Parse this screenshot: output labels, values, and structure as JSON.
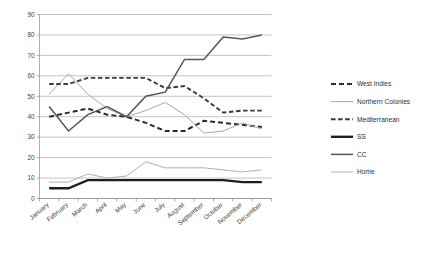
{
  "chart_data": {
    "type": "line",
    "title": "",
    "subtitle": "",
    "xlabel": "",
    "ylabel": "",
    "ylim": [
      0,
      90
    ],
    "ytick_step": 10,
    "yticks": [
      "0",
      "10",
      "20",
      "30",
      "40",
      "50",
      "60",
      "70",
      "80",
      "90"
    ],
    "grid": true,
    "legend_position": "right",
    "categories": [
      "January",
      "February",
      "March",
      "April",
      "May",
      "June",
      "July",
      "August",
      "September",
      "October",
      "November",
      "December"
    ],
    "series": [
      {
        "name": "West Indies",
        "style": "dashed",
        "color": "#2b2b2b",
        "width": 2.0,
        "dash": "5,3",
        "values": [
          40,
          42,
          44,
          41,
          40,
          37,
          33,
          33,
          38,
          37,
          36,
          35
        ]
      },
      {
        "name": "Northern Colonies",
        "style": "solid",
        "color": "#a8a8a8",
        "width": 1.0,
        "dash": "",
        "values": [
          51,
          61,
          51,
          44,
          40,
          43,
          47,
          41,
          32,
          33,
          37,
          34
        ]
      },
      {
        "name": "Mediterranean",
        "style": "dashed",
        "color": "#3a3a3a",
        "width": 1.9,
        "dash": "4.5,2.6",
        "values": [
          56,
          56,
          59,
          59,
          59,
          59,
          54,
          55,
          49,
          42,
          43,
          43
        ]
      },
      {
        "name": "SS",
        "style": "solid",
        "color": "#1e1e1e",
        "width": 2.4,
        "dash": "",
        "values": [
          5,
          5,
          9,
          9,
          9,
          9,
          9,
          9,
          9,
          9,
          8,
          8
        ]
      },
      {
        "name": "CC",
        "style": "solid",
        "color": "#555555",
        "width": 1.5,
        "dash": "",
        "values": [
          45,
          33,
          41,
          45,
          40,
          50,
          52,
          68,
          68,
          79,
          78,
          80
        ]
      },
      {
        "name": "Home",
        "style": "solid",
        "color": "#b0b0b0",
        "width": 1.0,
        "dash": "",
        "values": [
          8,
          8,
          12,
          10,
          11,
          18,
          15,
          15,
          15,
          14,
          13,
          14
        ]
      }
    ]
  },
  "legend": {
    "entries": [
      {
        "label": "West Indies"
      },
      {
        "label": "Northern Colonies"
      },
      {
        "label": "Mediterranean"
      },
      {
        "label": "SS"
      },
      {
        "label": "CC"
      },
      {
        "label": "Home"
      }
    ]
  }
}
